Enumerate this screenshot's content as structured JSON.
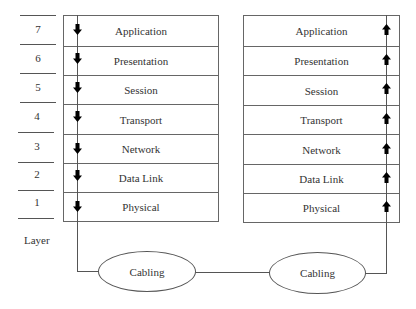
{
  "diagram": {
    "layer_axis_label": "Layer",
    "layer_numbers": [
      "7",
      "6",
      "5",
      "4",
      "3",
      "2",
      "1"
    ],
    "sender_stack": {
      "direction": "down",
      "layers": [
        "Application",
        "Presentation",
        "Session",
        "Transport",
        "Network",
        "Data Link",
        "Physical"
      ]
    },
    "receiver_stack": {
      "direction": "up",
      "layers": [
        "Application",
        "Presentation",
        "Session",
        "Transport",
        "Network",
        "Data Link",
        "Physical"
      ]
    },
    "media": [
      {
        "label": "Cabling"
      },
      {
        "label": "Cabling"
      }
    ],
    "colors": {
      "line": "#555555",
      "arrow": "#000000",
      "text": "#333333",
      "background": "#ffffff"
    }
  }
}
